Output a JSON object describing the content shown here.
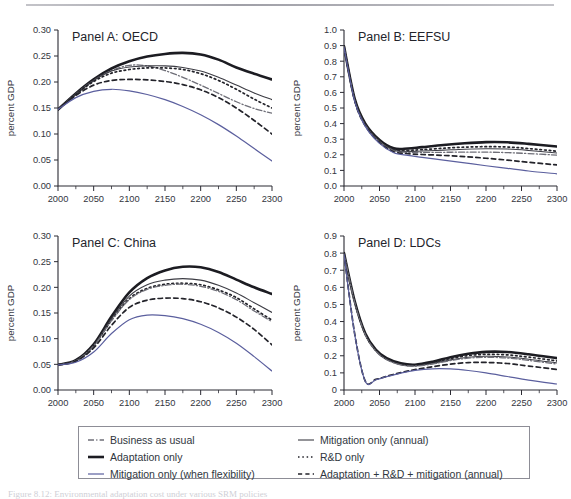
{
  "figure": {
    "caption": "Figure 8.12: Environmental adaptation cost under various SRM policies",
    "ghost_header": ""
  },
  "legend": {
    "items": [
      {
        "label": "Business as usual",
        "style": "dashdot",
        "color": "#6f6f78",
        "width": 1.3,
        "column": "left"
      },
      {
        "label": "Adaptation only",
        "style": "solid",
        "color": "#1c1c22",
        "width": 2.6,
        "column": "left"
      },
      {
        "label": "Mitigation only (when flexibility)",
        "style": "solid",
        "color": "#5b5f9e",
        "width": 1.2,
        "column": "left"
      },
      {
        "label": "Mitigation only (annual)",
        "style": "solid",
        "color": "#3c3c44",
        "width": 1.1,
        "column": "right"
      },
      {
        "label": "R&D only",
        "style": "dotted",
        "color": "#23232a",
        "width": 1.6,
        "column": "right"
      },
      {
        "label": "Adaptation + R&D + mitigation (annual)",
        "style": "dashed",
        "color": "#23232a",
        "width": 1.6,
        "column": "right"
      }
    ]
  },
  "chart_data": [
    {
      "type": "line",
      "panel_id": "A",
      "title": "Panel A: OECD",
      "xlabel": "",
      "ylabel": "percent GDP",
      "xlim": [
        2000,
        2300
      ],
      "ylim": [
        0.0,
        0.3
      ],
      "xticks": [
        2000,
        2050,
        2100,
        2150,
        2200,
        2250,
        2300
      ],
      "yticks": [
        0.0,
        0.05,
        0.1,
        0.15,
        0.2,
        0.25,
        0.3
      ],
      "ytick_labels": [
        "0.00",
        "0.05",
        "0.10",
        "0.15",
        "0.20",
        "0.25",
        "0.30"
      ],
      "minor_xtick_step": 25,
      "grid": false,
      "x": [
        2000,
        2025,
        2050,
        2075,
        2100,
        2125,
        2150,
        2175,
        2200,
        2225,
        2250,
        2275,
        2300
      ],
      "series": [
        {
          "name": "Adaptation only",
          "style": "solid",
          "color": "#1c1c22",
          "width": 2.6,
          "values": [
            0.147,
            0.178,
            0.205,
            0.226,
            0.24,
            0.249,
            0.254,
            0.256,
            0.253,
            0.243,
            0.228,
            0.216,
            0.205
          ]
        },
        {
          "name": "Business as usual",
          "style": "dashdot",
          "color": "#6f6f78",
          "width": 1.3,
          "values": [
            0.147,
            0.177,
            0.203,
            0.222,
            0.232,
            0.231,
            0.222,
            0.209,
            0.194,
            0.178,
            0.162,
            0.149,
            0.14
          ]
        },
        {
          "name": "Mitigation only (annual)",
          "style": "solid",
          "color": "#3c3c44",
          "width": 1.1,
          "values": [
            0.147,
            0.177,
            0.203,
            0.221,
            0.229,
            0.231,
            0.231,
            0.228,
            0.221,
            0.209,
            0.194,
            0.179,
            0.166
          ]
        },
        {
          "name": "R&D only",
          "style": "dotted",
          "color": "#23232a",
          "width": 1.7,
          "values": [
            0.147,
            0.176,
            0.201,
            0.217,
            0.224,
            0.227,
            0.227,
            0.224,
            0.216,
            0.203,
            0.186,
            0.167,
            0.15
          ]
        },
        {
          "name": "Adaptation + R&D + mitigation (annual)",
          "style": "dashed",
          "color": "#23232a",
          "width": 1.7,
          "values": [
            0.147,
            0.174,
            0.194,
            0.203,
            0.205,
            0.204,
            0.201,
            0.195,
            0.185,
            0.17,
            0.15,
            0.126,
            0.1
          ]
        },
        {
          "name": "Mitigation only (when flexibility)",
          "style": "solid",
          "color": "#5b5f9e",
          "width": 1.2,
          "values": [
            0.147,
            0.17,
            0.182,
            0.186,
            0.183,
            0.176,
            0.166,
            0.153,
            0.137,
            0.118,
            0.096,
            0.072,
            0.048
          ]
        }
      ]
    },
    {
      "type": "line",
      "panel_id": "B",
      "title": "Panel B: EEFSU",
      "xlabel": "",
      "ylabel": "percent GDP",
      "xlim": [
        2000,
        2300
      ],
      "ylim": [
        0.0,
        1.0
      ],
      "xticks": [
        2000,
        2050,
        2100,
        2150,
        2200,
        2250,
        2300
      ],
      "yticks": [
        0.0,
        0.1,
        0.2,
        0.3,
        0.4,
        0.5,
        0.6,
        0.7,
        0.8,
        0.9,
        1.0
      ],
      "ytick_labels": [
        "0.0",
        "0.1",
        "0.2",
        "0.3",
        "0.4",
        "0.5",
        "0.6",
        "0.7",
        "0.8",
        "0.9",
        "1.0"
      ],
      "minor_xtick_step": 25,
      "grid": false,
      "x": [
        2000,
        2015,
        2030,
        2050,
        2070,
        2090,
        2110,
        2140,
        2170,
        2200,
        2230,
        2260,
        2300
      ],
      "series": [
        {
          "name": "Adaptation only",
          "style": "solid",
          "color": "#1c1c22",
          "width": 2.6,
          "values": [
            0.895,
            0.56,
            0.4,
            0.295,
            0.242,
            0.24,
            0.249,
            0.263,
            0.274,
            0.281,
            0.28,
            0.27,
            0.253
          ]
        },
        {
          "name": "R&D only",
          "style": "dotted",
          "color": "#23232a",
          "width": 1.7,
          "values": [
            0.895,
            0.556,
            0.396,
            0.29,
            0.235,
            0.229,
            0.233,
            0.242,
            0.249,
            0.252,
            0.25,
            0.24,
            0.223
          ]
        },
        {
          "name": "Mitigation only (annual)",
          "style": "solid",
          "color": "#3c3c44",
          "width": 1.1,
          "values": [
            0.893,
            0.553,
            0.392,
            0.286,
            0.23,
            0.222,
            0.224,
            0.23,
            0.236,
            0.239,
            0.237,
            0.228,
            0.212
          ]
        },
        {
          "name": "Business as usual",
          "style": "dashdot",
          "color": "#6f6f78",
          "width": 1.3,
          "values": [
            0.893,
            0.552,
            0.39,
            0.284,
            0.226,
            0.216,
            0.215,
            0.216,
            0.217,
            0.217,
            0.214,
            0.208,
            0.198
          ]
        },
        {
          "name": "Adaptation + R&D + mitigation (annual)",
          "style": "dashed",
          "color": "#23232a",
          "width": 1.7,
          "values": [
            0.89,
            0.548,
            0.386,
            0.278,
            0.22,
            0.207,
            0.202,
            0.196,
            0.188,
            0.178,
            0.166,
            0.152,
            0.135
          ]
        },
        {
          "name": "Mitigation only (when flexibility)",
          "style": "solid",
          "color": "#5b5f9e",
          "width": 1.2,
          "values": [
            0.888,
            0.545,
            0.382,
            0.273,
            0.213,
            0.196,
            0.184,
            0.166,
            0.148,
            0.13,
            0.113,
            0.096,
            0.078
          ]
        }
      ]
    },
    {
      "type": "line",
      "panel_id": "C",
      "title": "Panel C: China",
      "xlabel": "",
      "ylabel": "percent GDP",
      "xlim": [
        2000,
        2300
      ],
      "ylim": [
        0.0,
        0.3
      ],
      "xticks": [
        2000,
        2050,
        2100,
        2150,
        2200,
        2250,
        2300
      ],
      "yticks": [
        0.0,
        0.05,
        0.1,
        0.15,
        0.2,
        0.25,
        0.3
      ],
      "ytick_labels": [
        "0.00",
        "0.05",
        "0.10",
        "0.15",
        "0.20",
        "0.25",
        "0.30"
      ],
      "minor_xtick_step": 25,
      "grid": false,
      "x": [
        2000,
        2025,
        2050,
        2075,
        2100,
        2125,
        2150,
        2175,
        2200,
        2225,
        2250,
        2275,
        2300
      ],
      "series": [
        {
          "name": "Adaptation only",
          "style": "solid",
          "color": "#1c1c22",
          "width": 2.6,
          "values": [
            0.049,
            0.058,
            0.089,
            0.143,
            0.19,
            0.218,
            0.233,
            0.24,
            0.239,
            0.23,
            0.215,
            0.2,
            0.187
          ]
        },
        {
          "name": "Mitigation only (annual)",
          "style": "solid",
          "color": "#3c3c44",
          "width": 1.1,
          "values": [
            0.049,
            0.057,
            0.087,
            0.139,
            0.183,
            0.205,
            0.214,
            0.217,
            0.214,
            0.204,
            0.189,
            0.17,
            0.151
          ]
        },
        {
          "name": "R&D only",
          "style": "dotted",
          "color": "#23232a",
          "width": 1.7,
          "values": [
            0.049,
            0.057,
            0.086,
            0.136,
            0.178,
            0.198,
            0.206,
            0.208,
            0.205,
            0.195,
            0.18,
            0.158,
            0.136
          ]
        },
        {
          "name": "Business as usual",
          "style": "dashdot",
          "color": "#6f6f78",
          "width": 1.3,
          "values": [
            0.049,
            0.057,
            0.086,
            0.135,
            0.176,
            0.196,
            0.204,
            0.206,
            0.202,
            0.192,
            0.176,
            0.154,
            0.133
          ]
        },
        {
          "name": "Adaptation + R&D + mitigation (annual)",
          "style": "dashed",
          "color": "#23232a",
          "width": 1.7,
          "values": [
            0.049,
            0.056,
            0.082,
            0.126,
            0.161,
            0.175,
            0.179,
            0.178,
            0.172,
            0.16,
            0.142,
            0.118,
            0.088
          ]
        },
        {
          "name": "Mitigation only (when flexibility)",
          "style": "solid",
          "color": "#5b5f9e",
          "width": 1.2,
          "values": [
            0.049,
            0.054,
            0.074,
            0.11,
            0.137,
            0.146,
            0.145,
            0.139,
            0.128,
            0.112,
            0.091,
            0.065,
            0.037
          ]
        }
      ]
    },
    {
      "type": "line",
      "panel_id": "D",
      "title": "Panel D: LDCs",
      "xlabel": "",
      "ylabel": "percent GDP",
      "xlim": [
        2000,
        2300
      ],
      "ylim": [
        0.0,
        0.9
      ],
      "xticks": [
        2000,
        2050,
        2100,
        2150,
        2200,
        2250,
        2300
      ],
      "yticks": [
        0.0,
        0.1,
        0.2,
        0.3,
        0.4,
        0.5,
        0.6,
        0.7,
        0.8,
        0.9
      ],
      "ytick_labels": [
        "0",
        "0.1",
        "0.2",
        "0.3",
        "0.4",
        "0.5",
        "0.6",
        "0.7",
        "0.8",
        "0.9"
      ],
      "minor_xtick_step": 25,
      "grid": false,
      "x": [
        2000,
        2015,
        2030,
        2045,
        2060,
        2080,
        2100,
        2125,
        2150,
        2175,
        2200,
        2230,
        2260,
        2300
      ],
      "series": [
        {
          "name": "Adaptation only",
          "style": "solid",
          "color": "#1c1c22",
          "width": 2.6,
          "values": [
            0.8,
            0.52,
            0.33,
            0.235,
            0.186,
            0.156,
            0.148,
            0.165,
            0.192,
            0.212,
            0.223,
            0.222,
            0.209,
            0.186
          ]
        },
        {
          "name": "R&D only",
          "style": "dotted",
          "color": "#23232a",
          "width": 1.7,
          "values": [
            0.798,
            0.516,
            0.326,
            0.231,
            0.181,
            0.151,
            0.144,
            0.16,
            0.184,
            0.201,
            0.208,
            0.205,
            0.192,
            0.17
          ]
        },
        {
          "name": "Mitigation only (annual)",
          "style": "solid",
          "color": "#3c3c44",
          "width": 1.1,
          "values": [
            0.797,
            0.513,
            0.323,
            0.228,
            0.178,
            0.148,
            0.141,
            0.155,
            0.176,
            0.191,
            0.197,
            0.193,
            0.18,
            0.158
          ]
        },
        {
          "name": "Business as usual",
          "style": "dashdot",
          "color": "#6f6f78",
          "width": 1.3,
          "values": [
            0.797,
            0.512,
            0.322,
            0.227,
            0.177,
            0.147,
            0.14,
            0.152,
            0.172,
            0.186,
            0.191,
            0.187,
            0.173,
            0.152
          ]
        },
        {
          "name": "Adaptation + R&D + mitigation (annual)",
          "style": "dashed",
          "color": "#23232a",
          "width": 1.7,
          "values": [
            0.795,
            0.33,
            0.052,
            0.062,
            0.08,
            0.102,
            0.119,
            0.136,
            0.151,
            0.16,
            0.161,
            0.155,
            0.14,
            0.12
          ]
        },
        {
          "name": "Mitigation only (when flexibility)",
          "style": "solid",
          "color": "#5b5f9e",
          "width": 1.2,
          "values": [
            0.793,
            0.326,
            0.05,
            0.06,
            0.078,
            0.099,
            0.115,
            0.124,
            0.123,
            0.114,
            0.1,
            0.079,
            0.058,
            0.035
          ]
        }
      ]
    }
  ],
  "panel_layout": [
    {
      "panel_id": "A",
      "left": 0,
      "top": 0,
      "width": 286,
      "height": 206
    },
    {
      "panel_id": "B",
      "left": 286,
      "top": 0,
      "width": 285,
      "height": 206
    },
    {
      "panel_id": "C",
      "left": 0,
      "top": 206,
      "width": 286,
      "height": 204
    },
    {
      "panel_id": "D",
      "left": 286,
      "top": 206,
      "width": 285,
      "height": 204
    }
  ]
}
